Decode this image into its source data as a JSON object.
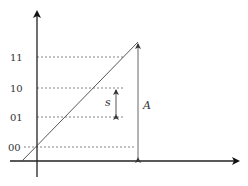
{
  "diagram": {
    "y_levels": [
      {
        "label": "11",
        "y": 57
      },
      {
        "label": "10",
        "y": 88
      },
      {
        "label": "01",
        "y": 117
      },
      {
        "label": "00",
        "y": 147
      }
    ],
    "step_label": "s",
    "amplitude_label": "A",
    "colors": {
      "axis": "#222222",
      "line": "#444444",
      "dashed": "#555555",
      "text": "#333333"
    }
  }
}
